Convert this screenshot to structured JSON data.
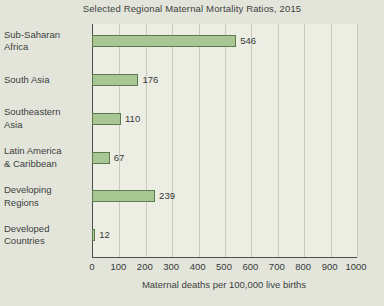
{
  "chart_data": {
    "type": "bar",
    "orientation": "horizontal",
    "title": "Selected Regional Maternal Mortality Ratios, 2015",
    "xlabel": "Maternal deaths per 100,000 live births",
    "ylabel": "",
    "categories": [
      "Sub-Saharan Africa",
      "South Asia",
      "Southeastern Asia",
      "Latin America & Caribbean",
      "Developing Regions",
      "Developed Countries"
    ],
    "category_lines": [
      [
        "Sub-Saharan",
        "Africa"
      ],
      [
        "South Asia"
      ],
      [
        "Southeastern",
        "Asia"
      ],
      [
        "Latin America",
        "& Caribbean"
      ],
      [
        "Developing",
        "Regions"
      ],
      [
        "Developed",
        "Countries"
      ]
    ],
    "values": [
      546,
      176,
      110,
      67,
      239,
      12
    ],
    "value_labels": [
      "546",
      "176",
      "110",
      "67",
      "239",
      "12"
    ],
    "xlim": [
      0,
      1000
    ],
    "xticks": [
      0,
      100,
      200,
      300,
      400,
      500,
      600,
      700,
      800,
      900,
      1000
    ],
    "xtick_labels": [
      "0",
      "100",
      "200",
      "300",
      "400",
      "500",
      "600",
      "700",
      "800",
      "900",
      "1000"
    ],
    "grid": "vertical",
    "legend": null,
    "colors": {
      "bar_fill": "#a9c793",
      "bar_border": "#5c7a4c",
      "plot_background": "#edeee3",
      "page_background": "#e3e5da",
      "axis_line": "#4a5149",
      "gridline": "#c9cbbc",
      "text": "#3c4140"
    }
  }
}
